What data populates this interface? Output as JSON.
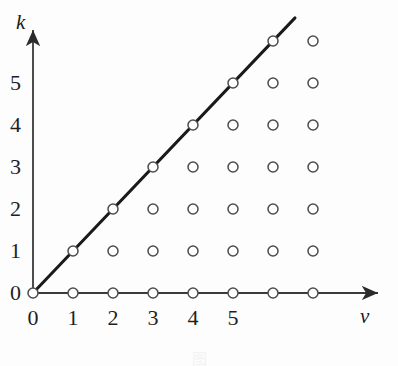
{
  "figure": {
    "axis_labels": {
      "y": "k",
      "x": "v"
    },
    "caption_fragment": "图"
  },
  "chart_data": {
    "type": "scatter",
    "title": "",
    "subtitle": "",
    "xlabel": "v",
    "ylabel": "k",
    "xlim": [
      -0.25,
      8.8
    ],
    "ylim": [
      -0.35,
      7.0
    ],
    "grid": false,
    "legend": null,
    "legend_position": "none",
    "xticks": [
      0,
      1,
      2,
      3,
      4,
      5
    ],
    "xtick_labels": [
      "0",
      "1",
      "2",
      "3",
      "4",
      "5"
    ],
    "yticks": [
      0,
      1,
      2,
      3,
      4,
      5
    ],
    "ytick_labels": [
      "0",
      "1",
      "2",
      "3",
      "4",
      "5"
    ],
    "marker": "open-circle",
    "marker_face_color": "#ffffff",
    "marker_edge_color": "#4c4c4c",
    "axis_color": "#3a3a3a",
    "line_color": "#1a1a1a",
    "points": [
      {
        "v": 0,
        "k": 0
      },
      {
        "v": 1,
        "k": 0
      },
      {
        "v": 1,
        "k": 1
      },
      {
        "v": 2,
        "k": 0
      },
      {
        "v": 2,
        "k": 1
      },
      {
        "v": 2,
        "k": 2
      },
      {
        "v": 3,
        "k": 0
      },
      {
        "v": 3,
        "k": 1
      },
      {
        "v": 3,
        "k": 2
      },
      {
        "v": 3,
        "k": 3
      },
      {
        "v": 4,
        "k": 0
      },
      {
        "v": 4,
        "k": 1
      },
      {
        "v": 4,
        "k": 2
      },
      {
        "v": 4,
        "k": 3
      },
      {
        "v": 4,
        "k": 4
      },
      {
        "v": 5,
        "k": 0
      },
      {
        "v": 5,
        "k": 1
      },
      {
        "v": 5,
        "k": 2
      },
      {
        "v": 5,
        "k": 3
      },
      {
        "v": 5,
        "k": 4
      },
      {
        "v": 5,
        "k": 5
      },
      {
        "v": 6,
        "k": 0
      },
      {
        "v": 6,
        "k": 1
      },
      {
        "v": 6,
        "k": 2
      },
      {
        "v": 6,
        "k": 3
      },
      {
        "v": 6,
        "k": 4
      },
      {
        "v": 6,
        "k": 5
      },
      {
        "v": 6,
        "k": 6
      },
      {
        "v": 7,
        "k": 0
      },
      {
        "v": 7,
        "k": 1
      },
      {
        "v": 7,
        "k": 2
      },
      {
        "v": 7,
        "k": 3
      },
      {
        "v": 7,
        "k": 4
      },
      {
        "v": 7,
        "k": 5
      },
      {
        "v": 7,
        "k": 6
      }
    ],
    "line": {
      "equation": "k = v",
      "slope": 1,
      "intercept": 0,
      "from": {
        "v": 0,
        "k": 0
      },
      "to": {
        "v": 6.55,
        "k": 6.55
      },
      "width_px": 3
    },
    "geometry": {
      "origin_x_px": 33,
      "origin_y_px": 293,
      "x_step_px": 40,
      "y_step_px": 42,
      "marker_radius_px": 5,
      "x_axis_end_px": 388,
      "y_axis_top_px": 22
    }
  }
}
